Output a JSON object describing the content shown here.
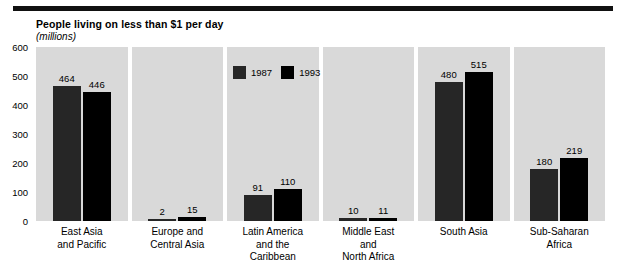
{
  "chart_data": {
    "type": "bar",
    "title": "People living on less than $1 per day",
    "subtitle": "(millions)",
    "xlabel": "",
    "ylabel": "",
    "ylim": [
      0,
      600
    ],
    "yticks": [
      0,
      100,
      200,
      300,
      400,
      500,
      600
    ],
    "grid": false,
    "legend_position": "inside-panel-3-top",
    "categories": [
      "East Asia\nand Pacific",
      "Europe and\nCentral Asia",
      "Latin America\nand the\nCaribbean",
      "Middle East\nand\nNorth Africa",
      "South Asia",
      "Sub-Saharan\nAfrica"
    ],
    "series": [
      {
        "name": "1987",
        "color": "#262626",
        "values": [
          464,
          2,
          91,
          10,
          480,
          180
        ]
      },
      {
        "name": "1993",
        "color": "#000000",
        "values": [
          446,
          15,
          110,
          11,
          515,
          219
        ]
      }
    ]
  },
  "legend": {
    "items": [
      {
        "label": "1987",
        "color": "#262626"
      },
      {
        "label": "1993",
        "color": "#000000"
      }
    ]
  },
  "colors": {
    "panel_background": "#d9d9d9",
    "rule": "#111111",
    "text": "#000000"
  }
}
